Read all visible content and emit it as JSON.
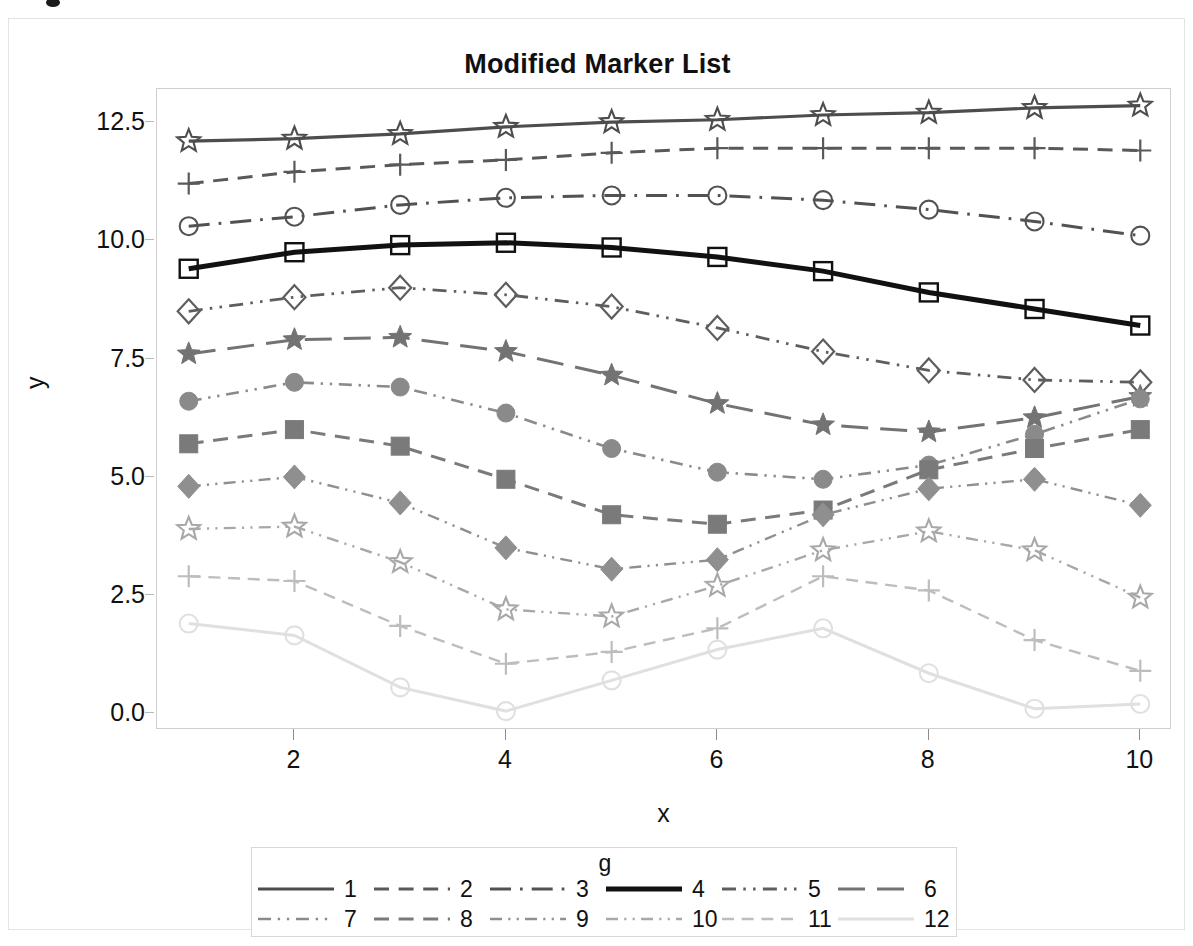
{
  "chart_data": {
    "type": "line",
    "title": "Modified Marker List",
    "xlabel": "x",
    "ylabel": "y",
    "xlim": [
      0.7,
      10.3
    ],
    "ylim": [
      -0.35,
      13.2
    ],
    "xticks": [
      2,
      4,
      6,
      8,
      10
    ],
    "yticks": [
      "0.0",
      "2.5",
      "5.0",
      "7.5",
      "10.0",
      "12.5"
    ],
    "grid": false,
    "legend": {
      "title": "g",
      "position": "bottom",
      "entries": [
        "1",
        "2",
        "3",
        "4",
        "5",
        "6",
        "7",
        "8",
        "9",
        "10",
        "11",
        "12"
      ]
    },
    "x": [
      1,
      2,
      3,
      4,
      5,
      6,
      7,
      8,
      9,
      10
    ],
    "series": [
      {
        "name": "1",
        "marker": "star-open",
        "dash": "solid",
        "color": "#4d4d4d",
        "width": 3.2,
        "values": [
          12.1,
          12.15,
          12.25,
          12.4,
          12.5,
          12.55,
          12.65,
          12.7,
          12.8,
          12.85
        ]
      },
      {
        "name": "2",
        "marker": "plus",
        "dash": "dashed",
        "color": "#595959",
        "width": 3.0,
        "values": [
          11.2,
          11.45,
          11.6,
          11.7,
          11.85,
          11.95,
          11.95,
          11.95,
          11.95,
          11.9
        ]
      },
      {
        "name": "3",
        "marker": "circle-open",
        "dash": "dash-dot",
        "color": "#525252",
        "width": 3.0,
        "values": [
          10.3,
          10.5,
          10.75,
          10.9,
          10.95,
          10.95,
          10.85,
          10.65,
          10.4,
          10.1
        ]
      },
      {
        "name": "4",
        "marker": "square-open",
        "dash": "solid",
        "color": "#111111",
        "width": 5.0,
        "values": [
          9.4,
          9.75,
          9.9,
          9.95,
          9.85,
          9.65,
          9.35,
          8.9,
          8.55,
          8.2
        ]
      },
      {
        "name": "5",
        "marker": "diamond-open",
        "dash": "dash-dot-dot",
        "color": "#5e5e5e",
        "width": 2.8,
        "values": [
          8.5,
          8.8,
          9.0,
          8.85,
          8.6,
          8.15,
          7.65,
          7.25,
          7.05,
          7.0
        ]
      },
      {
        "name": "6",
        "marker": "star-filled",
        "dash": "long-dash",
        "color": "#737373",
        "width": 3.0,
        "values": [
          7.6,
          7.9,
          7.95,
          7.65,
          7.15,
          6.55,
          6.1,
          5.95,
          6.25,
          6.7
        ]
      },
      {
        "name": "7",
        "marker": "circle-filled",
        "dash": "dash-dot-dot",
        "color": "#8a8a8a",
        "width": 2.6,
        "values": [
          6.6,
          7.0,
          6.9,
          6.35,
          5.6,
          5.1,
          4.95,
          5.25,
          5.9,
          6.65
        ]
      },
      {
        "name": "8",
        "marker": "square-filled",
        "dash": "dashed",
        "color": "#7a7a7a",
        "width": 3.0,
        "values": [
          5.7,
          6.0,
          5.65,
          4.95,
          4.2,
          4.0,
          4.3,
          5.15,
          5.6,
          6.0
        ]
      },
      {
        "name": "9",
        "marker": "diamond-filled",
        "dash": "dash-dot-dot",
        "color": "#8f8f8f",
        "width": 2.4,
        "values": [
          4.8,
          5.0,
          4.45,
          3.5,
          3.05,
          3.25,
          4.2,
          4.75,
          4.95,
          4.4
        ]
      },
      {
        "name": "10",
        "marker": "star-open",
        "dash": "dash-dot-dot",
        "color": "#a8a8a8",
        "width": 2.4,
        "values": [
          3.9,
          3.95,
          3.2,
          2.2,
          2.05,
          2.7,
          3.45,
          3.85,
          3.45,
          2.45
        ]
      },
      {
        "name": "11",
        "marker": "plus",
        "dash": "dashed",
        "color": "#bdbdbd",
        "width": 2.4,
        "values": [
          2.9,
          2.8,
          1.85,
          1.05,
          1.3,
          1.8,
          2.9,
          2.6,
          1.55,
          0.9
        ]
      },
      {
        "name": "12",
        "marker": "circle-open",
        "dash": "solid",
        "color": "#e0e0e0",
        "width": 3.0,
        "values": [
          1.9,
          1.65,
          0.55,
          0.05,
          0.7,
          1.35,
          1.8,
          0.85,
          0.1,
          0.2
        ]
      }
    ]
  }
}
